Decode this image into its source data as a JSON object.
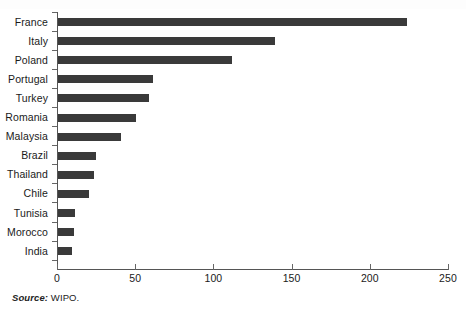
{
  "chart_data": {
    "type": "bar",
    "orientation": "horizontal",
    "title": "",
    "xlabel": "",
    "ylabel": "",
    "categories": [
      "France",
      "Italy",
      "Poland",
      "Portugal",
      "Turkey",
      "Romania",
      "Malaysia",
      "Brazil",
      "Thailand",
      "Chile",
      "Tunisia",
      "Morocco",
      "India"
    ],
    "values": [
      223,
      139,
      111,
      61,
      58,
      50,
      40,
      24,
      23,
      20,
      11,
      10,
      9
    ],
    "xlim": [
      0,
      250
    ],
    "xticks": [
      0,
      50,
      100,
      150,
      200,
      250
    ],
    "xtick_labels": [
      "0",
      "50",
      "100",
      "150",
      "200",
      "250"
    ],
    "grid": false,
    "legend": null,
    "bar_color": "#3a3a3a",
    "axis_color": "#555555"
  },
  "source": {
    "label": "Source:",
    "value": "WIPO."
  }
}
